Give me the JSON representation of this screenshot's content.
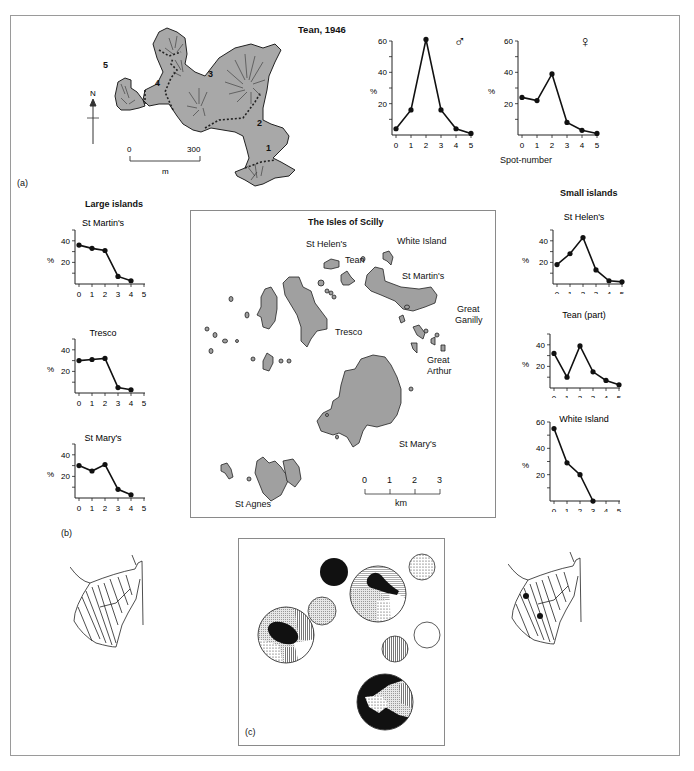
{
  "figure": {
    "panel_labels": {
      "a": "(a)",
      "b": "(b)",
      "c": "(c)"
    }
  },
  "tean_map": {
    "title": "Tean, 1946",
    "zones": [
      "1",
      "2",
      "3",
      "4",
      "5"
    ],
    "north_label": "N",
    "scale": {
      "start": "0",
      "end": "300",
      "unit": "m"
    },
    "fill_color": "#a8a8a8"
  },
  "large_islands": {
    "heading": "Large islands"
  },
  "small_islands": {
    "heading": "Small islands"
  },
  "scilly_map": {
    "title": "The Isles of Scilly",
    "labels": {
      "st_helens": "St Helen's",
      "white_island": "White Island",
      "tean": "Tean",
      "st_martins": "St Martin's",
      "great_ganilly_1": "Great",
      "great_ganilly_2": "Ganilly",
      "tresco": "Tresco",
      "great_arthur_1": "Great",
      "great_arthur_2": "Arthur",
      "st_marys": "St Mary's",
      "st_agnes": "St Agnes"
    },
    "scale": {
      "ticks": [
        "0",
        "1",
        "2",
        "3"
      ],
      "unit": "km"
    },
    "fill_color": "#a0a0a0"
  },
  "chart_data": [
    {
      "id": "tean_male",
      "type": "line",
      "title": "♂",
      "x": [
        0,
        1,
        2,
        3,
        4,
        5
      ],
      "values": [
        4,
        16,
        61,
        16,
        4,
        1
      ],
      "xlabel": "Spot-number",
      "ylabel": "%",
      "ylim": [
        0,
        60
      ],
      "yticks": [
        20,
        40,
        60
      ],
      "xticks": [
        "0",
        "1",
        "2",
        "3",
        "4",
        "5"
      ]
    },
    {
      "id": "tean_female",
      "type": "line",
      "title": "♀",
      "x": [
        0,
        1,
        2,
        3,
        4,
        5
      ],
      "values": [
        24,
        22,
        39,
        8,
        3,
        1
      ],
      "xlabel": "Spot-number",
      "ylabel": "%",
      "ylim": [
        0,
        60
      ],
      "yticks": [
        20,
        40,
        60
      ],
      "xticks": [
        "0",
        "1",
        "2",
        "3",
        "4",
        "5"
      ]
    },
    {
      "id": "st_martins",
      "group": "Large islands",
      "type": "line",
      "title": "St Martin's",
      "x": [
        0,
        1,
        2,
        3,
        4
      ],
      "values": [
        36,
        33,
        31,
        7,
        3
      ],
      "ylabel": "%",
      "ylim": [
        0,
        50
      ],
      "yticks": [
        20,
        40
      ],
      "xticks": [
        "0",
        "1",
        "2",
        "3",
        "4",
        "5"
      ]
    },
    {
      "id": "tresco",
      "group": "Large islands",
      "type": "line",
      "title": "Tresco",
      "x": [
        0,
        1,
        2,
        3,
        4
      ],
      "values": [
        30,
        31,
        32,
        5,
        3
      ],
      "ylabel": "%",
      "ylim": [
        0,
        50
      ],
      "yticks": [
        20,
        40
      ],
      "xticks": [
        "0",
        "1",
        "2",
        "3",
        "4",
        "5"
      ]
    },
    {
      "id": "st_marys",
      "group": "Large islands",
      "type": "line",
      "title": "St Mary's",
      "x": [
        0,
        1,
        2,
        3,
        4
      ],
      "values": [
        30,
        25,
        31,
        8,
        3
      ],
      "ylabel": "%",
      "ylim": [
        0,
        50
      ],
      "yticks": [
        20,
        40
      ],
      "xticks": [
        "0",
        "1",
        "2",
        "3",
        "4",
        "5"
      ]
    },
    {
      "id": "st_helens",
      "group": "Small islands",
      "type": "line",
      "title": "St Helen's",
      "x": [
        0,
        1,
        2,
        3,
        4,
        5
      ],
      "values": [
        18,
        28,
        43,
        13,
        3,
        2
      ],
      "ylabel": "%",
      "ylim": [
        0,
        50
      ],
      "yticks": [
        20,
        40
      ],
      "xticks": [
        "0",
        "1",
        "2",
        "3",
        "4",
        "5"
      ]
    },
    {
      "id": "tean_part",
      "group": "Small islands",
      "type": "line",
      "title": "Tean (part)",
      "x": [
        0,
        1,
        2,
        3,
        4,
        5
      ],
      "values": [
        32,
        10,
        39,
        15,
        7,
        3
      ],
      "ylabel": "%",
      "ylim": [
        0,
        50
      ],
      "yticks": [
        20,
        40
      ],
      "xticks": [
        "0",
        "1",
        "2",
        "3",
        "4",
        "5"
      ]
    },
    {
      "id": "white_island",
      "group": "Small islands",
      "type": "line",
      "title": "White Island",
      "x": [
        0,
        1,
        2,
        3
      ],
      "values": [
        55,
        29,
        20,
        0
      ],
      "ylabel": "%",
      "ylim": [
        0,
        60
      ],
      "yticks": [
        20,
        40,
        60
      ],
      "xticks": [
        "0",
        "1",
        "2",
        "3",
        "4",
        "5"
      ]
    }
  ]
}
